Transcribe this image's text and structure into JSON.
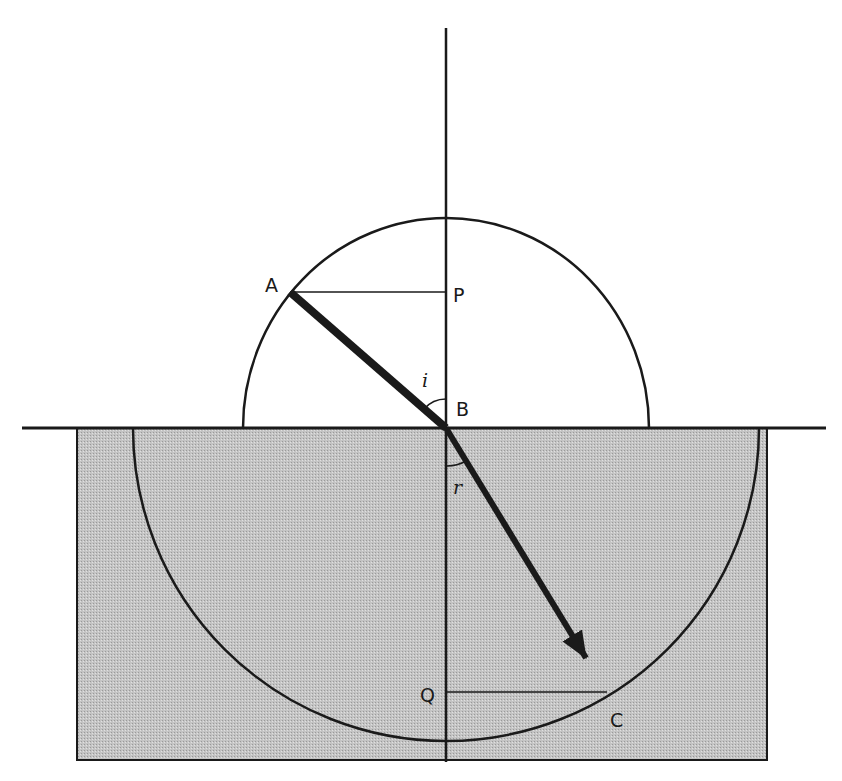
{
  "diagram": {
    "type": "refraction",
    "colors": {
      "line": "#1a1a1a",
      "glass": "#bdbdbd",
      "background": "#ffffff"
    },
    "labels": {
      "A": "A",
      "P": "P",
      "B": "B",
      "i": "i",
      "r": "r",
      "Q": "Q",
      "C": "C"
    },
    "points": {
      "A": [
        290,
        292
      ],
      "P": [
        446,
        292
      ],
      "B": [
        446,
        428
      ],
      "Q": [
        446,
        692
      ],
      "C": [
        607,
        692
      ]
    },
    "upper_circle_radius": 208,
    "lower_circle_radius": 313
  }
}
